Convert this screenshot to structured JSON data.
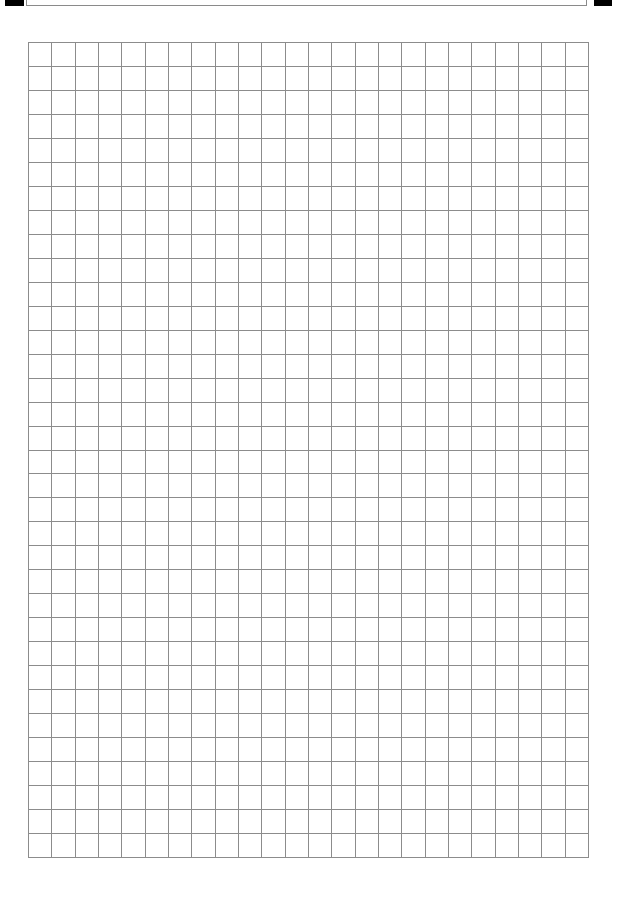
{
  "page": {
    "width": 617,
    "height": 900,
    "background": "#ffffff"
  },
  "header": {
    "left_mark": {
      "x": 5,
      "width": 19,
      "color": "#000000"
    },
    "box": {
      "x": 26,
      "width": 561,
      "border_color": "#8a8a8a",
      "text": ""
    },
    "right_mark": {
      "x": 594,
      "width": 18,
      "color": "#000000"
    }
  },
  "grid": {
    "x": 28,
    "y": 42,
    "width": 560,
    "height": 815,
    "columns": 24,
    "rows": 34,
    "line_color": "#8c8c8c",
    "line_width": 1
  }
}
